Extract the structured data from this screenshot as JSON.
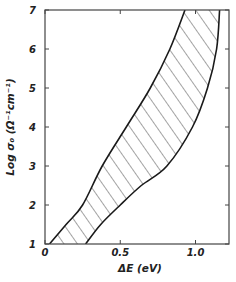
{
  "chart_data": {
    "type": "area",
    "title": "",
    "xlabel": "ΔE (eV)",
    "ylabel": "Log σ₀ (Ω⁻¹cm⁻¹)",
    "xlim": [
      0,
      1.2
    ],
    "ylim": [
      1,
      7
    ],
    "x_ticks": [
      0,
      0.5,
      1.0
    ],
    "x_tick_labels": [
      "0",
      "0.5",
      "1.0"
    ],
    "y_ticks": [
      1,
      2,
      3,
      4,
      5,
      6,
      7
    ],
    "y_tick_labels": [
      "1",
      "2",
      "3",
      "4",
      "5",
      "6",
      "7"
    ],
    "grid": false,
    "fill_style": "hatched",
    "series": [
      {
        "name": "upper-left boundary",
        "points": [
          [
            0.03,
            1.0
          ],
          [
            0.14,
            1.5
          ],
          [
            0.25,
            2.0
          ],
          [
            0.38,
            3.0
          ],
          [
            0.54,
            4.0
          ],
          [
            0.7,
            5.0
          ],
          [
            0.83,
            6.0
          ],
          [
            0.93,
            7.0
          ]
        ]
      },
      {
        "name": "lower-right boundary",
        "points": [
          [
            0.27,
            1.0
          ],
          [
            0.37,
            1.5
          ],
          [
            0.5,
            2.0
          ],
          [
            0.64,
            2.5
          ],
          [
            0.81,
            3.0
          ],
          [
            0.98,
            4.0
          ],
          [
            1.08,
            5.0
          ],
          [
            1.14,
            6.0
          ],
          [
            1.16,
            7.0
          ]
        ]
      }
    ]
  },
  "labels": {
    "xlabel": "ΔE (eV)",
    "ylabel": "Log σ₀ (Ω⁻¹cm⁻¹)"
  }
}
